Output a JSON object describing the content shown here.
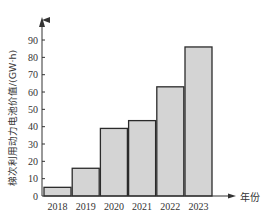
{
  "chart_data": {
    "type": "bar",
    "title": "",
    "xlabel": "年份",
    "ylabel": "梯次利用动力电池价值/(GW·h)",
    "categories": [
      "2018",
      "2019",
      "2020",
      "2021",
      "2022",
      "2023"
    ],
    "values": [
      5,
      16,
      39,
      43.5,
      63,
      86
    ],
    "ylim": [
      0,
      100
    ],
    "yticks": [
      0,
      10,
      20,
      30,
      40,
      50,
      60,
      70,
      80,
      90
    ],
    "grid": false,
    "legend": null,
    "colors": {
      "bar_fill": "#d4d4d4",
      "bar_edge": "#2b2b2b",
      "axis": "#333333"
    }
  }
}
